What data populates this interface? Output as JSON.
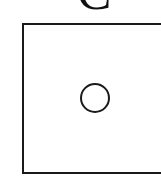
{
  "figure": {
    "label": "C",
    "panel": {
      "shape": "rectangle",
      "stroke_color": "#1a1a1a",
      "fill_color": "#ffffff"
    },
    "marker": {
      "shape": "circle",
      "stroke_color": "#1a1a1a",
      "fill_color": "none"
    }
  }
}
